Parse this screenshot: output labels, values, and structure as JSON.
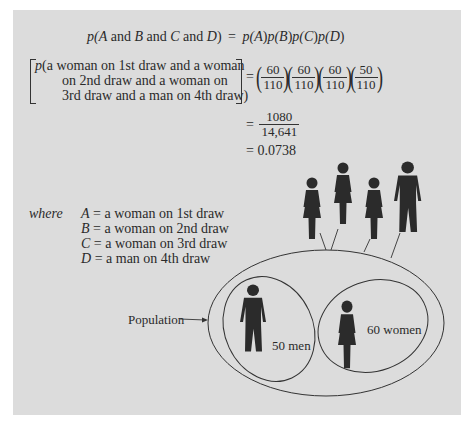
{
  "formula": {
    "general": {
      "lhs_parts": [
        "p(",
        "A",
        " and ",
        "B",
        " and ",
        "C",
        " and ",
        "D",
        ")"
      ],
      "equals": "=",
      "rhs_parts": [
        "p(",
        "A",
        ")",
        "p(",
        "B",
        ")",
        "p(",
        "C",
        ")",
        "p(",
        "D",
        ")"
      ]
    },
    "specific": {
      "lhs_line1_p": "p",
      "lhs_line1": "(a woman on 1st draw and a woman",
      "lhs_line2": "on 2nd draw and a woman on",
      "lhs_line3": "3rd draw and a man on 4th draw)",
      "equals": "=",
      "factors": [
        {
          "num": "60",
          "den": "110"
        },
        {
          "num": "60",
          "den": "110"
        },
        {
          "num": "60",
          "den": "110"
        },
        {
          "num": "50",
          "den": "110"
        }
      ]
    },
    "step2": {
      "equals": "=",
      "num": "1080",
      "den": "14,641"
    },
    "step3": {
      "equals": "=",
      "value": "0.0738"
    }
  },
  "definitions": {
    "where_label": "where",
    "items": [
      {
        "var": "A",
        "eq": "=",
        "text": "a woman on 1st draw"
      },
      {
        "var": "B",
        "eq": "=",
        "text": "a woman on 2nd draw"
      },
      {
        "var": "C",
        "eq": "=",
        "text": "a woman on 3rd draw"
      },
      {
        "var": "D",
        "eq": "=",
        "text": "a man on 4th draw"
      }
    ]
  },
  "diagram": {
    "population_label": "Population",
    "men_label": "50 men",
    "women_label": "60 women",
    "drawn_sample": [
      "woman",
      "woman",
      "woman",
      "man"
    ],
    "colors": {
      "panel": "#dcdcdc",
      "figure": "#2b2b2b",
      "line": "#333333"
    }
  }
}
